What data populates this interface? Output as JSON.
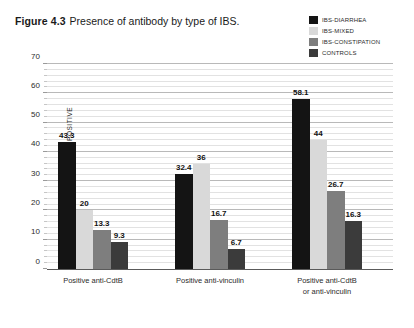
{
  "caption": {
    "label": "Figure 4.3",
    "text": "Presence of antibody by type of IBS."
  },
  "chart_data": {
    "type": "bar",
    "title": "Presence of antibody by type of IBS.",
    "xlabel": "",
    "ylabel": "PERCENT OF PATIENTS POSITIVE",
    "ylim": [
      0,
      70
    ],
    "ytick_step": 10,
    "yticks": [
      0,
      10,
      20,
      30,
      40,
      50,
      60,
      70
    ],
    "ytick_labels": [
      "0",
      "10",
      "20",
      "30",
      "40",
      "50",
      "60",
      "70"
    ],
    "minor_gridlines": true,
    "grid": true,
    "legend_position": "top-right",
    "categories": [
      "Positive anti-CdtB",
      "Positive anti-vinculin",
      "Positive anti-CdtB or anti-vinculin"
    ],
    "category_lines": [
      [
        "Positive anti-CdtB"
      ],
      [
        "Positive anti-vinculin"
      ],
      [
        "Positive anti-CdtB",
        "or anti-vinculin"
      ]
    ],
    "series": [
      {
        "name": "IBS-DIARRHEA",
        "color": "#141414",
        "values": [
          43.3,
          32.4,
          58.1
        ],
        "labels": [
          "43.3",
          "32.4",
          "58.1"
        ]
      },
      {
        "name": "IBS-MIXED",
        "color": "#d9d9d9",
        "values": [
          20,
          36,
          44
        ],
        "labels": [
          "20",
          "36",
          "44"
        ]
      },
      {
        "name": "IBS-CONSTIPATION",
        "color": "#7e7e7e",
        "values": [
          13.3,
          16.7,
          26.7
        ],
        "labels": [
          "13.3",
          "16.7",
          "26.7"
        ]
      },
      {
        "name": "CONTROLS",
        "color": "#3b3b3b",
        "values": [
          9.3,
          6.7,
          16.3
        ],
        "labels": [
          "9.3",
          "6.7",
          "16.3"
        ]
      }
    ]
  },
  "colors": {
    "ibs_diarrhea": "#141414",
    "ibs_mixed": "#d9d9d9",
    "ibs_constipation": "#7e7e7e",
    "controls": "#3b3b3b",
    "gridline_major": "#b9b9b9",
    "gridline_minor": "#e2e2e2",
    "axis": "#5a5a5a"
  }
}
